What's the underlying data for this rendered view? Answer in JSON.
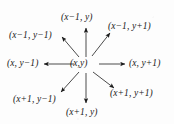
{
  "figure": {
    "type": "neighborhood-diagram",
    "title": "",
    "background_color": "#fdfdfd",
    "ink_color": "#1a1a1a",
    "center": {
      "label": "(x,y)",
      "x": 86,
      "y": 64
    },
    "neighbors": [
      {
        "key": "up",
        "label": "(x−1, y)",
        "direction": "up",
        "angle_deg": 90,
        "text_x": 61,
        "text_y": 13
      },
      {
        "key": "up-right",
        "label": "(x−1, y+1)",
        "direction": "up-right",
        "angle_deg": 45,
        "text_x": 110,
        "text_y": 22
      },
      {
        "key": "up-left",
        "label": "(x−1, y−1)",
        "direction": "up-left",
        "angle_deg": 135,
        "text_x": 9,
        "text_y": 31
      },
      {
        "key": "left",
        "label": "(x, y−1)",
        "direction": "left",
        "angle_deg": 180,
        "text_x": 7,
        "text_y": 60
      },
      {
        "key": "right",
        "label": "(x, y+1)",
        "direction": "right",
        "angle_deg": 0,
        "text_x": 128,
        "text_y": 60
      },
      {
        "key": "down-left",
        "label": "(x+1, y−1)",
        "direction": "down-left",
        "angle_deg": 225,
        "text_x": 13,
        "text_y": 95
      },
      {
        "key": "down-right",
        "label": "(x+1, y+1)",
        "direction": "down-right",
        "angle_deg": 315,
        "text_x": 110,
        "text_y": 90
      },
      {
        "key": "down",
        "label": "(x+1, y)",
        "direction": "down",
        "angle_deg": 270,
        "text_x": 66,
        "text_y": 108
      }
    ]
  }
}
